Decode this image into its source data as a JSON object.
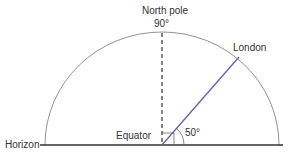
{
  "diagram": {
    "title_top": "North pole",
    "angle_top": "90°",
    "city": "London",
    "equator_label": "Equator",
    "angle_label": "50°",
    "horizon_label": "Horizon",
    "colors": {
      "line": "#333333",
      "arc": "#777777",
      "london_line": "#6a5fb0"
    }
  }
}
